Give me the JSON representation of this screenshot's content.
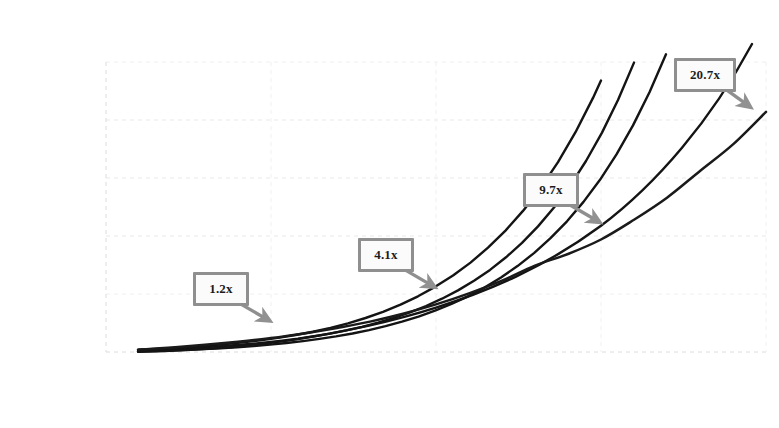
{
  "chart_data": {
    "type": "line",
    "title": "Investment Milestones by Decade",
    "xlabel": "Age (years)",
    "ylabel": "Multiples of Income",
    "xlim": [
      20,
      60
    ],
    "ylim": [
      0,
      25
    ],
    "xticks": [
      20,
      30,
      40,
      50,
      60
    ],
    "yticks": [
      0,
      5,
      10,
      15,
      20,
      25
    ],
    "xtick_labels": [
      "20",
      "30",
      "40",
      "50",
      "60"
    ],
    "ytick_labels": [
      "0",
      "5",
      "10",
      "15",
      "20",
      "25"
    ],
    "grid": "dotted-light",
    "legend": "none",
    "series": [
      {
        "name": "Multiples of Income",
        "color": "#1a1a1a",
        "x": [
          22,
          24,
          26,
          28,
          30,
          32,
          34,
          36,
          38,
          40,
          42,
          44,
          46,
          48,
          50,
          52,
          54,
          56,
          58,
          60
        ],
        "values": [
          0.2,
          0.39,
          0.62,
          0.89,
          1.2,
          1.6,
          2.08,
          2.62,
          3.3,
          4.1,
          5.05,
          6.15,
          7.45,
          8.45,
          9.7,
          11.4,
          13.3,
          15.6,
          17.9,
          20.7
        ]
      }
    ],
    "annotations": [
      {
        "label": "1.2x",
        "x": 30,
        "y": 1.2,
        "value": 1.2
      },
      {
        "label": "4.1x",
        "x": 40,
        "y": 4.1,
        "value": 4.1
      },
      {
        "label": "9.7x",
        "x": 50,
        "y": 9.7,
        "value": 9.7
      },
      {
        "label": "20.7x",
        "x": 60,
        "y": 20.7,
        "value": 20.7
      }
    ],
    "colors": {
      "line": "#1a1a1a",
      "annotation_border": "#8f8f8f",
      "annotation_fill": "#fbfbfb",
      "arrow": "#8f8f8f",
      "grid": "#e3e3e3",
      "text": "#141414",
      "background": "#ffffff"
    }
  }
}
